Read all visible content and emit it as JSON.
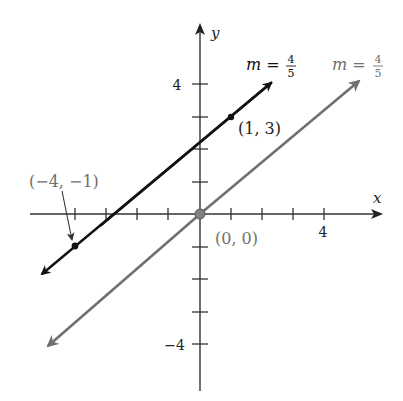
{
  "diagram": {
    "type": "coordinate-plane-lines",
    "axes": {
      "x_label": "x",
      "y_label": "y",
      "x_tick_label": "4",
      "y_tick_label_pos": "4",
      "y_tick_label_neg": "−4",
      "x_range": [
        -5,
        6
      ],
      "y_range": [
        -5,
        6
      ]
    },
    "lines": [
      {
        "name": "black-line",
        "slope_label": "m = 4/5",
        "slope_prefix": "m =",
        "slope_num": "4",
        "slope_den": "5",
        "color": "#111111",
        "points": [
          {
            "label": "(1, 3)",
            "x": 1,
            "y": 3
          },
          {
            "label": "(−4, −1)",
            "x": -4,
            "y": -1
          }
        ]
      },
      {
        "name": "gray-line",
        "slope_label": "m = 4/5",
        "slope_prefix": "m =",
        "slope_num": "4",
        "slope_den": "5",
        "color": "#707070",
        "points": [
          {
            "label": "(0, 0)",
            "x": 0,
            "y": 0
          }
        ]
      }
    ]
  }
}
